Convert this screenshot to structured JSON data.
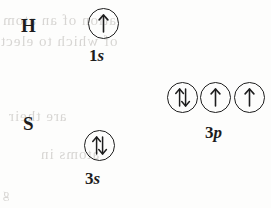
{
  "diagram": {
    "type": "orbital-box-diagram",
    "background_color": "#fdfdfc",
    "ink_color": "#1c1c1c",
    "rows": [
      {
        "element_symbol": "H",
        "subshells": [
          {
            "label_n": "1",
            "label_l": "s",
            "full_label": "1s",
            "orbitals": [
              {
                "electrons": 1,
                "spins": [
                  "up"
                ]
              }
            ]
          }
        ]
      },
      {
        "element_symbol": "S",
        "subshells": [
          {
            "label_n": "3",
            "label_l": "s",
            "full_label": "3s",
            "orbitals": [
              {
                "electrons": 2,
                "spins": [
                  "up",
                  "down"
                ]
              }
            ]
          },
          {
            "label_n": "3",
            "label_l": "p",
            "full_label": "3p",
            "orbitals": [
              {
                "electrons": 2,
                "spins": [
                  "up",
                  "down"
                ]
              },
              {
                "electrons": 1,
                "spins": [
                  "up"
                ]
              },
              {
                "electrons": 1,
                "spins": [
                  "up"
                ]
              }
            ]
          }
        ]
      }
    ]
  },
  "background_showthrough": {
    "note": "faint mirrored text bleeding through from the reverse side of the page",
    "lines": [
      "ation  of  an  atom",
      "of  which  to  elect",
      "are  their",
      "atoms  in",
      "g"
    ]
  }
}
